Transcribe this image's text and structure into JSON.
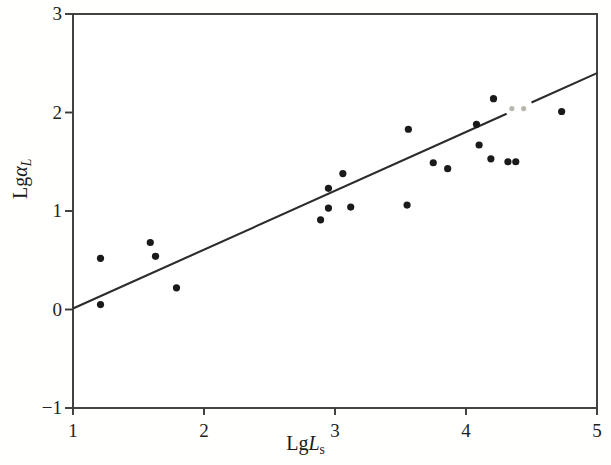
{
  "chart_data": {
    "type": "scatter",
    "title": "",
    "xlabel": "LgL_s",
    "ylabel": "Lgα_L",
    "xlabel_parts": {
      "prefix": "Lg",
      "italic": "L",
      "sub": "s"
    },
    "ylabel_parts": {
      "prefix": "Lg",
      "italic": "α",
      "sub": "L"
    },
    "xlim": [
      1,
      5
    ],
    "ylim": [
      -1,
      3
    ],
    "xticks": [
      "1",
      "2",
      "3",
      "4",
      "5"
    ],
    "xtick_values": [
      1,
      2,
      3,
      4,
      5
    ],
    "yticks": [
      "3",
      "2",
      "1",
      "0",
      "−1"
    ],
    "ytick_values": [
      3,
      2,
      1,
      0,
      -1
    ],
    "grid": false,
    "legend": null,
    "marker_color": "#1a1a1a",
    "marker_size_px": 6,
    "line_color": "#2b2b2b",
    "axis_color": "#3a3a3a",
    "x": [
      1.21,
      1.21,
      1.59,
      1.63,
      1.79,
      2.89,
      2.95,
      2.95,
      3.06,
      3.12,
      3.55,
      3.56,
      3.75,
      3.86,
      4.08,
      4.1,
      4.19,
      4.21,
      4.32,
      4.38,
      4.73
    ],
    "y": [
      0.52,
      0.05,
      0.68,
      0.54,
      0.22,
      0.91,
      1.23,
      1.03,
      1.38,
      1.04,
      1.06,
      1.83,
      1.49,
      1.43,
      1.88,
      1.67,
      1.53,
      2.14,
      1.5,
      1.5,
      2.01
    ],
    "faded_points": {
      "x": [
        4.35,
        4.44
      ],
      "y": [
        2.04,
        2.04
      ],
      "color": "#b9b6ae",
      "note": "scan artifact dots on trend line"
    },
    "trendline": {
      "x": [
        1.0,
        5.0
      ],
      "y": [
        0.01,
        2.4
      ],
      "slope": 0.5975,
      "intercept": -0.5875,
      "gap_x": [
        4.31,
        4.5
      ]
    }
  }
}
